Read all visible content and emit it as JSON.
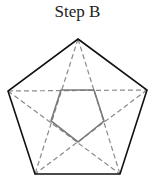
{
  "title": "Step B",
  "diagram": {
    "type": "pentagon-with-inscribed-star",
    "outer_pentagon": [
      [
        78,
        39
      ],
      [
        147,
        90
      ],
      [
        120,
        174
      ],
      [
        35,
        174
      ],
      [
        8,
        91
      ]
    ],
    "diagonals_style": "dashed",
    "inner_pentagon_style": "solid-gray",
    "colors": {
      "outline": "#111111",
      "diagonal": "#8a8a8a",
      "inner": "#7a7a7a"
    }
  }
}
